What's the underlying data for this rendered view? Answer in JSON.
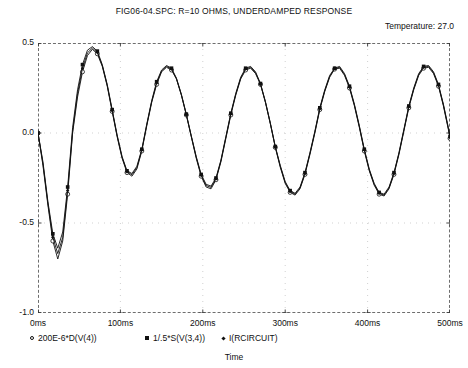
{
  "title": "FIG06-04.SPC: R=10 OHMS, UNDERDAMPED RESPONSE",
  "temperature_label": "Temperature:  27.0",
  "axis_label_x": "Time",
  "legend": [
    {
      "marker": "circle-open-marker",
      "label": "200E-6*D(V(4))"
    },
    {
      "marker": "square-filled-marker",
      "label": "1/.5*S(V(3,4))"
    },
    {
      "marker": "diamond-dot-marker",
      "label": "I(RCIRCUIT)"
    }
  ],
  "chart_data": {
    "type": "line",
    "title": "FIG06-04.SPC: R=10 OHMS, UNDERDAMPED RESPONSE",
    "xlabel": "Time",
    "ylabel": "",
    "xlim": [
      0,
      500
    ],
    "ylim": [
      -1.0,
      0.5
    ],
    "grid": true,
    "legend_position": "below",
    "x_tick_labels": [
      "0ms",
      "100ms",
      "200ms",
      "300ms",
      "400ms",
      "500ms"
    ],
    "x_ticks": [
      0,
      100,
      200,
      300,
      400,
      500
    ],
    "y_ticks": [
      0.5,
      0.0,
      -0.5,
      -1.0
    ],
    "y_tick_labels": [
      "0.5",
      "0.0",
      "-0.5",
      "-1.0"
    ],
    "series": [
      {
        "name": "200E-6*D(V(4))",
        "marker": "circle-open",
        "x": [
          0,
          6,
          12,
          18,
          24,
          30,
          36,
          42,
          48,
          54,
          60,
          66,
          72,
          78,
          84,
          90,
          96,
          102,
          108,
          114,
          120,
          126,
          132,
          138,
          144,
          150,
          156,
          162,
          168,
          174,
          180,
          186,
          192,
          198,
          204,
          210,
          216,
          222,
          228,
          234,
          240,
          246,
          252,
          258,
          264,
          270,
          276,
          282,
          288,
          294,
          300,
          306,
          312,
          318,
          324,
          330,
          336,
          342,
          348,
          354,
          360,
          366,
          372,
          378,
          384,
          390,
          396,
          402,
          408,
          414,
          420,
          426,
          432,
          438,
          444,
          450,
          456,
          462,
          468,
          474,
          480,
          486,
          492,
          498,
          500
        ],
        "y": [
          0.0,
          -0.18,
          -0.4,
          -0.6,
          -0.7,
          -0.6,
          -0.34,
          0.0,
          0.2,
          0.34,
          0.43,
          0.465,
          0.44,
          0.37,
          0.26,
          0.12,
          -0.02,
          -0.14,
          -0.22,
          -0.24,
          -0.2,
          -0.1,
          0.04,
          0.17,
          0.27,
          0.34,
          0.365,
          0.35,
          0.3,
          0.21,
          0.1,
          -0.02,
          -0.14,
          -0.24,
          -0.3,
          -0.31,
          -0.26,
          -0.16,
          -0.03,
          0.1,
          0.21,
          0.3,
          0.35,
          0.36,
          0.33,
          0.27,
          0.17,
          0.05,
          -0.08,
          -0.19,
          -0.28,
          -0.33,
          -0.345,
          -0.31,
          -0.23,
          -0.12,
          0.0,
          0.13,
          0.23,
          0.31,
          0.355,
          0.36,
          0.32,
          0.25,
          0.15,
          0.03,
          -0.1,
          -0.21,
          -0.29,
          -0.34,
          -0.35,
          -0.31,
          -0.23,
          -0.12,
          0.01,
          0.14,
          0.24,
          0.32,
          0.36,
          0.365,
          0.33,
          0.26,
          0.15,
          0.02,
          -0.03
        ]
      },
      {
        "name": "1/.5*S(V(3,4))",
        "marker": "square-filled",
        "x": [
          0,
          6,
          12,
          18,
          24,
          30,
          36,
          42,
          48,
          54,
          60,
          66,
          72,
          78,
          84,
          90,
          96,
          102,
          108,
          114,
          120,
          126,
          132,
          138,
          144,
          150,
          156,
          162,
          168,
          174,
          180,
          186,
          192,
          198,
          204,
          210,
          216,
          222,
          228,
          234,
          240,
          246,
          252,
          258,
          264,
          270,
          276,
          282,
          288,
          294,
          300,
          306,
          312,
          318,
          324,
          330,
          336,
          342,
          348,
          354,
          360,
          366,
          372,
          378,
          384,
          390,
          396,
          402,
          408,
          414,
          420,
          426,
          432,
          438,
          444,
          450,
          456,
          462,
          468,
          474,
          480,
          486,
          492,
          498,
          500
        ],
        "y": [
          0.0,
          -0.16,
          -0.38,
          -0.56,
          -0.64,
          -0.55,
          -0.3,
          0.03,
          0.24,
          0.38,
          0.46,
          0.48,
          0.455,
          0.38,
          0.27,
          0.13,
          -0.01,
          -0.13,
          -0.21,
          -0.225,
          -0.185,
          -0.09,
          0.05,
          0.18,
          0.285,
          0.35,
          0.375,
          0.36,
          0.305,
          0.215,
          0.105,
          -0.015,
          -0.13,
          -0.23,
          -0.285,
          -0.295,
          -0.25,
          -0.15,
          -0.02,
          0.11,
          0.22,
          0.31,
          0.36,
          0.37,
          0.34,
          0.275,
          0.175,
          0.055,
          -0.075,
          -0.18,
          -0.27,
          -0.32,
          -0.335,
          -0.3,
          -0.22,
          -0.11,
          0.01,
          0.14,
          0.24,
          0.32,
          0.36,
          0.37,
          0.33,
          0.26,
          0.16,
          0.04,
          -0.09,
          -0.2,
          -0.28,
          -0.33,
          -0.34,
          -0.3,
          -0.22,
          -0.11,
          0.02,
          0.15,
          0.25,
          0.33,
          0.37,
          0.375,
          0.34,
          0.27,
          0.16,
          0.03,
          -0.02
        ]
      },
      {
        "name": "I(RCIRCUIT)",
        "marker": "diamond-dot",
        "x": [
          0,
          6,
          12,
          18,
          24,
          30,
          36,
          42,
          48,
          54,
          60,
          66,
          72,
          78,
          84,
          90,
          96,
          102,
          108,
          114,
          120,
          126,
          132,
          138,
          144,
          150,
          156,
          162,
          168,
          174,
          180,
          186,
          192,
          198,
          204,
          210,
          216,
          222,
          228,
          234,
          240,
          246,
          252,
          258,
          264,
          270,
          276,
          282,
          288,
          294,
          300,
          306,
          312,
          318,
          324,
          330,
          336,
          342,
          348,
          354,
          360,
          366,
          372,
          378,
          384,
          390,
          396,
          402,
          408,
          414,
          420,
          426,
          432,
          438,
          444,
          450,
          456,
          462,
          468,
          474,
          480,
          486,
          492,
          498,
          500
        ],
        "y": [
          0.0,
          -0.17,
          -0.39,
          -0.58,
          -0.67,
          -0.58,
          -0.32,
          0.01,
          0.22,
          0.36,
          0.445,
          0.472,
          0.447,
          0.375,
          0.265,
          0.125,
          -0.015,
          -0.135,
          -0.215,
          -0.232,
          -0.192,
          -0.095,
          0.045,
          0.175,
          0.278,
          0.345,
          0.37,
          0.355,
          0.302,
          0.212,
          0.102,
          -0.018,
          -0.135,
          -0.235,
          -0.292,
          -0.302,
          -0.255,
          -0.155,
          -0.025,
          0.105,
          0.215,
          0.305,
          0.355,
          0.365,
          0.335,
          0.272,
          0.172,
          0.052,
          -0.078,
          -0.185,
          -0.275,
          -0.325,
          -0.34,
          -0.305,
          -0.225,
          -0.115,
          0.005,
          0.135,
          0.235,
          0.315,
          0.357,
          0.365,
          0.325,
          0.255,
          0.155,
          0.035,
          -0.095,
          -0.205,
          -0.285,
          -0.335,
          -0.345,
          -0.305,
          -0.225,
          -0.115,
          0.015,
          0.145,
          0.245,
          0.325,
          0.365,
          0.37,
          0.335,
          0.265,
          0.155,
          0.025,
          -0.025
        ]
      }
    ]
  }
}
